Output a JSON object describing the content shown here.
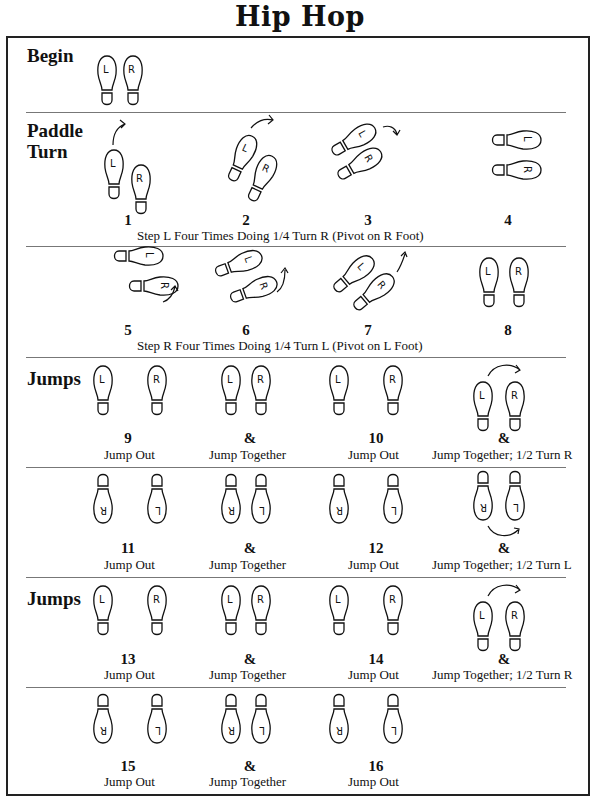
{
  "title": "Hip Hop",
  "sections": {
    "begin": {
      "label": "Begin"
    },
    "paddle": {
      "label_line1": "Paddle",
      "label_line2": "Turn"
    },
    "jumps1": {
      "label": "Jumps"
    },
    "jumps2": {
      "label": "Jumps"
    }
  },
  "paddle_row1": {
    "counts": [
      "1",
      "2",
      "3",
      "4"
    ],
    "description": "Step L Four Times Doing 1/4 Turn R (Pivot on R Foot)"
  },
  "paddle_row2": {
    "counts": [
      "5",
      "6",
      "7",
      "8"
    ],
    "description": "Step R Four Times Doing 1/4 Turn L (Pivot on L Foot)"
  },
  "jump_rows": [
    {
      "steps": [
        {
          "count": "9",
          "caption": "Jump Out"
        },
        {
          "count": "&",
          "caption": "Jump Together"
        },
        {
          "count": "10",
          "caption": "Jump Out"
        },
        {
          "count": "&",
          "caption": "Jump Together; 1/2 Turn R"
        }
      ]
    },
    {
      "steps": [
        {
          "count": "11",
          "caption": "Jump Out"
        },
        {
          "count": "&",
          "caption": "Jump Together"
        },
        {
          "count": "12",
          "caption": "Jump Out"
        },
        {
          "count": "&",
          "caption": "Jump Together; 1/2 Turn L"
        }
      ]
    },
    {
      "steps": [
        {
          "count": "13",
          "caption": "Jump Out"
        },
        {
          "count": "&",
          "caption": "Jump Together"
        },
        {
          "count": "14",
          "caption": "Jump Out"
        },
        {
          "count": "&",
          "caption": "Jump Together; 1/2 Turn R"
        }
      ]
    },
    {
      "steps": [
        {
          "count": "15",
          "caption": "Jump Out"
        },
        {
          "count": "&",
          "caption": "Jump Together"
        },
        {
          "count": "16",
          "caption": "Jump Out"
        }
      ]
    }
  ],
  "foot_labels": {
    "left": "L",
    "right": "R"
  }
}
